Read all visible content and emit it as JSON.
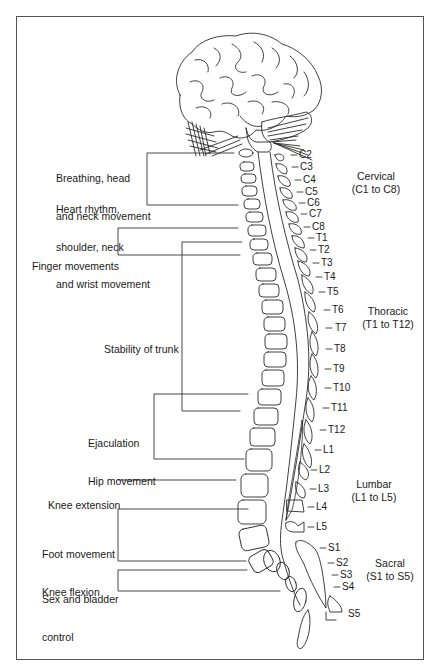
{
  "diagram": {
    "title": "",
    "functions": [
      {
        "id": "breathing",
        "lines": [
          "Breathing, head",
          "and neck movement"
        ]
      },
      {
        "id": "heart",
        "lines": [
          "Heart rhythm,",
          "shoulder, neck",
          "and wrist movement"
        ]
      },
      {
        "id": "finger",
        "lines": [
          "Finger movements"
        ]
      },
      {
        "id": "trunk",
        "lines": [
          "Stability of trunk"
        ]
      },
      {
        "id": "ejaculation",
        "lines": [
          "Ejaculation",
          "Hip movement"
        ]
      },
      {
        "id": "knee_ext",
        "lines": [
          "Knee extension"
        ]
      },
      {
        "id": "foot",
        "lines": [
          "Foot movement",
          "Knee flexion"
        ]
      },
      {
        "id": "sex",
        "lines": [
          "Sex and bladder",
          "control"
        ]
      }
    ],
    "segments": [
      "C2",
      "C3",
      "C4",
      "C5",
      "C6",
      "C7",
      "C8",
      "T1",
      "T2",
      "T3",
      "T4",
      "T5",
      "T6",
      "T7",
      "T8",
      "T9",
      "T10",
      "T11",
      "T12",
      "L1",
      "L2",
      "L3",
      "L4",
      "L5",
      "S1",
      "S2",
      "S3",
      "S4",
      "S5"
    ],
    "regions": [
      {
        "name": "Cervical",
        "range": "(C1 to C8)"
      },
      {
        "name": "Thoracic",
        "range": "(T1 to T12)"
      },
      {
        "name": "Lumbar",
        "range": "(L1 to L5)"
      },
      {
        "name": "Sacral",
        "range": "(S1 to S5)"
      }
    ]
  }
}
